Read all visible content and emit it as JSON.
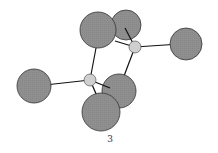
{
  "figure": {
    "label": "3",
    "colors": {
      "large_atom": "#8f8f8f",
      "small_atom": "#cfcfcf",
      "outline": "#333333",
      "bond": "#111111"
    },
    "atoms": {
      "terminal_left": {
        "cx": 34,
        "cy": 86,
        "r": 17,
        "type": "large"
      },
      "terminal_right": {
        "cx": 186,
        "cy": 44,
        "r": 16,
        "type": "large"
      },
      "bridge_back_top": {
        "cx": 126,
        "cy": 25,
        "r": 15,
        "type": "large"
      },
      "bridge_top": {
        "cx": 98,
        "cy": 30,
        "r": 18,
        "type": "large"
      },
      "bridge_back_bottom": {
        "cx": 119,
        "cy": 91,
        "r": 17,
        "type": "large"
      },
      "bridge_front_bottom": {
        "cx": 101,
        "cy": 112,
        "r": 19,
        "type": "large"
      },
      "center_top": {
        "cx": 135,
        "cy": 47,
        "r": 6,
        "type": "small"
      },
      "center_bottom": {
        "cx": 90,
        "cy": 80,
        "r": 6,
        "type": "small"
      }
    }
  }
}
